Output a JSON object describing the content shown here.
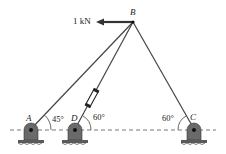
{
  "diagram": {
    "type": "truss-cable-statics",
    "points": {
      "B": {
        "label": "B"
      },
      "A": {
        "label": "A"
      },
      "D": {
        "label": "D"
      },
      "C": {
        "label": "C"
      }
    },
    "force": {
      "label": "1 kN",
      "direction": "left"
    },
    "angles": {
      "A": "45°",
      "D": "60°",
      "C": "60°"
    },
    "members": [
      "AB",
      "DB",
      "CB"
    ],
    "turnbuckle_member": "DB",
    "colors": {
      "line": "#444444",
      "support": "#555555",
      "ground": "#666666"
    }
  }
}
